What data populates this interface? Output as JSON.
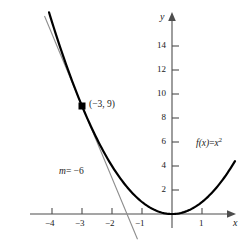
{
  "chart_data": {
    "type": "line",
    "title": "",
    "xlabel": "x",
    "ylabel": "y",
    "xlim": [
      -4.9,
      2.6
    ],
    "ylim": [
      -1.2,
      15.5
    ],
    "grid": false,
    "legend": "none",
    "series": [
      {
        "name": "f(x) = x^2",
        "type": "parabola",
        "expression": "x^2",
        "x_start": -4.1,
        "x_end": 2.1,
        "style": "thick-black"
      },
      {
        "name": "tangent line at x = -3",
        "type": "line",
        "expression": "-6x - 9",
        "slope": -6,
        "intercept": -9,
        "x_start": -4.25,
        "x_end": -1.15,
        "style": "thin-gray"
      }
    ],
    "points": [
      {
        "x": -3,
        "y": 9,
        "label": "(−3, 9)",
        "marker": "square"
      }
    ],
    "annotations": [
      {
        "text": "(−3, 9)",
        "x": -3,
        "y": 9
      },
      {
        "text": "m = −6",
        "x": -2.6,
        "y": 2.9
      },
      {
        "text": "f(x) = x²",
        "x": 1.2,
        "y": 5.6
      }
    ],
    "xticks": [
      -4,
      -3,
      -2,
      -1,
      1
    ],
    "xtick_labels": [
      "−4",
      "−3",
      "−2",
      "−1",
      "1"
    ],
    "yticks": [
      2,
      4,
      6,
      8,
      10,
      12,
      14
    ],
    "ytick_labels": [
      "2",
      "4",
      "6",
      "8",
      "10",
      "12",
      "14"
    ]
  },
  "labels": {
    "x_axis_name": "x",
    "y_axis_name": "y",
    "point_label": "(−3, 9)",
    "slope_label_lhs": "m",
    "slope_label_rhs": "= −6",
    "function_label_lhs": "f(x)",
    "function_label_eq": "=",
    "function_label_base": "x",
    "function_label_exp": "2"
  },
  "colors": {
    "curve": "#000000",
    "tangent": "#808080",
    "axis": "#4d4d4d",
    "text": "#1a1a1a",
    "background": "#ffffff"
  }
}
